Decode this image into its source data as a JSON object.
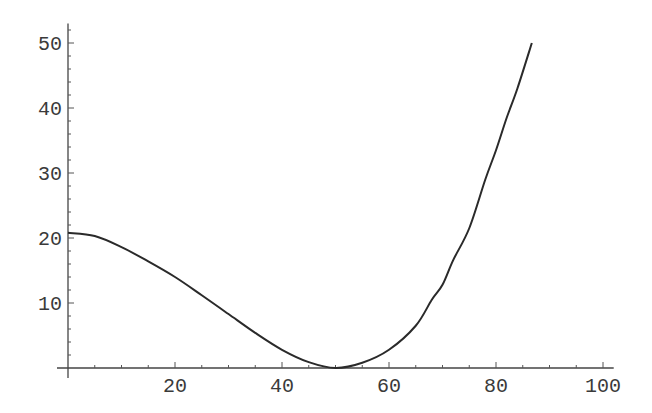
{
  "chart_data": {
    "type": "line",
    "title": "",
    "xlabel": "",
    "ylabel": "",
    "xlim": [
      0,
      102
    ],
    "ylim": [
      0,
      52
    ],
    "grid": false,
    "legend": null,
    "x_ticks": [
      20,
      40,
      60,
      80,
      100
    ],
    "y_ticks": [
      10,
      20,
      30,
      40,
      50
    ],
    "x_minor_step": 5,
    "y_minor_step": 2,
    "series": [
      {
        "name": "f(x)",
        "color": "#2a2a2a",
        "x": [
          0,
          5,
          10,
          15,
          20,
          25,
          30,
          35,
          40,
          45,
          50,
          55,
          60,
          65,
          68,
          70,
          72,
          75,
          78,
          80,
          82,
          84,
          86.7
        ],
        "y": [
          20.8,
          20.3,
          18.6,
          16.4,
          14.0,
          11.2,
          8.3,
          5.4,
          2.8,
          0.9,
          0.0,
          0.8,
          2.8,
          6.5,
          10.5,
          12.8,
          16.6,
          21.5,
          29.0,
          33.5,
          38.5,
          43.0,
          50.0
        ]
      }
    ]
  }
}
